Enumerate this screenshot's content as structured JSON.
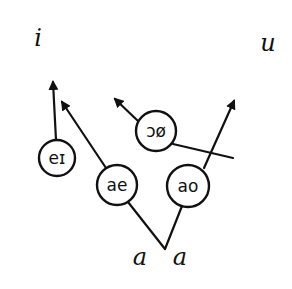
{
  "diagram": {
    "title": "",
    "targets": [
      {
        "id": "i",
        "label": "i",
        "x": 38,
        "y": 46
      },
      {
        "id": "u",
        "label": "u",
        "x": 268,
        "y": 51
      }
    ],
    "nodes": [
      {
        "id": "ei",
        "label": "eɪ",
        "cx": 57,
        "cy": 158,
        "r": 18
      },
      {
        "id": "ae",
        "label": "ae",
        "cx": 117,
        "cy": 185,
        "r": 20
      },
      {
        "id": "oo",
        "label": "ɔø",
        "cx": 156,
        "cy": 131,
        "r": 20
      },
      {
        "id": "ao",
        "label": "ao",
        "cx": 188,
        "cy": 186,
        "r": 21
      }
    ],
    "origins": [
      {
        "id": "a1",
        "label": "a",
        "x": 140,
        "y": 265
      },
      {
        "id": "a2",
        "label": "a",
        "x": 180,
        "y": 265
      }
    ],
    "arrows": [
      {
        "from": "ei",
        "x1": 56,
        "y1": 140,
        "x2": 53,
        "y2": 82
      },
      {
        "from": "ae",
        "x1": 106,
        "y1": 168,
        "x2": 62,
        "y2": 102
      },
      {
        "from": "oo",
        "x1": 138,
        "y1": 121,
        "x2": 115,
        "y2": 99
      },
      {
        "from": "ao",
        "x1": 204,
        "y1": 168,
        "x2": 234,
        "y2": 101
      }
    ],
    "lines": [
      {
        "desc": "oo-tail",
        "x1": 173,
        "y1": 144,
        "x2": 233,
        "y2": 158
      },
      {
        "desc": "v-left",
        "x1": 128,
        "y1": 202,
        "x2": 165,
        "y2": 249
      },
      {
        "desc": "v-right",
        "x1": 165,
        "y1": 249,
        "x2": 182,
        "y2": 206
      }
    ],
    "colors": {
      "ink": "#111111",
      "background": "#ffffff"
    }
  }
}
